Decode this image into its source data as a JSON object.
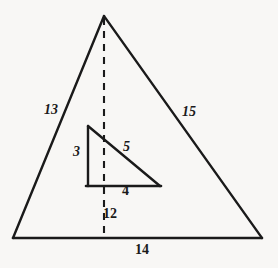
{
  "figure": {
    "kind": "geometry-diagram",
    "background_color": "#f8f7f5",
    "stroke_color": "#1a1a1a",
    "label_color": "#1a1a1a"
  },
  "outer_triangle": {
    "name": "large-triangle",
    "apex": {
      "x": 104,
      "y": 16
    },
    "bottom_left": {
      "x": 13,
      "y": 238
    },
    "bottom_right": {
      "x": 262,
      "y": 238
    },
    "labels": {
      "left_side": "13",
      "right_side": "15",
      "base": "14",
      "altitude": "12"
    }
  },
  "inner_triangle": {
    "name": "small-right-triangle",
    "top_left": {
      "x": 88,
      "y": 126
    },
    "bottom_left": {
      "x": 88,
      "y": 186
    },
    "bottom_right": {
      "x": 160,
      "y": 186
    },
    "labels": {
      "vertical_leg": "3",
      "hypotenuse": "5",
      "horizontal_leg": "4"
    }
  },
  "altitude": {
    "name": "dashed-altitude-line",
    "from": {
      "x": 104,
      "y": 16
    },
    "to": {
      "x": 104,
      "y": 238
    },
    "style": "dashed",
    "label": "12"
  },
  "labels": {
    "left_side": "13",
    "right_side": "15",
    "base": "14",
    "altitude": "12",
    "inner_vertical": "3",
    "inner_hypotenuse": "5",
    "inner_horizontal": "4"
  }
}
